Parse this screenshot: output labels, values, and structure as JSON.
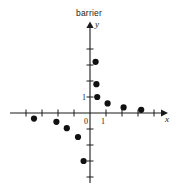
{
  "chart_data": {
    "type": "scatter",
    "title": "barrier",
    "xlabel": "x",
    "ylabel": "y",
    "grid": false,
    "legend": null,
    "xlim": [
      -4.5,
      4.5
    ],
    "ylim": [
      -4.5,
      5.0
    ],
    "x_tick_labels": [
      {
        "value": 0,
        "text": "0"
      },
      {
        "value": 1,
        "text": "1"
      }
    ],
    "y_tick_labels": [
      {
        "value": 1,
        "text": "1"
      }
    ],
    "x_ticks": [
      -4,
      -3,
      -2,
      -1,
      0,
      1,
      2,
      3,
      4
    ],
    "y_ticks": [
      -4,
      -3,
      -2,
      -1,
      1,
      2,
      3,
      4
    ],
    "points": [
      {
        "x": -3.5,
        "y": -0.35
      },
      {
        "x": -2.1,
        "y": -0.55
      },
      {
        "x": -1.45,
        "y": -0.95
      },
      {
        "x": -0.75,
        "y": -1.5
      },
      {
        "x": -0.4,
        "y": -3.0
      },
      {
        "x": 0.35,
        "y": 3.2
      },
      {
        "x": 0.4,
        "y": 1.8
      },
      {
        "x": 0.45,
        "y": 1.0
      },
      {
        "x": 1.1,
        "y": 0.6
      },
      {
        "x": 2.1,
        "y": 0.35
      },
      {
        "x": 3.2,
        "y": 0.2
      }
    ],
    "marker": {
      "shape": "circle",
      "size": 3.1,
      "color": "#111111"
    }
  },
  "geometry": {
    "origin_x": 90,
    "origin_y": 113,
    "unit_x": 16,
    "unit_y": 16,
    "x_axis_start": 10,
    "x_axis_end": 163,
    "y_axis_top": 26,
    "y_axis_bottom": 183
  },
  "labels": {
    "x_axis_name": "x",
    "y_axis_name": "y",
    "origin_label": "0",
    "x_one_label": "1",
    "y_one_label": "1"
  }
}
